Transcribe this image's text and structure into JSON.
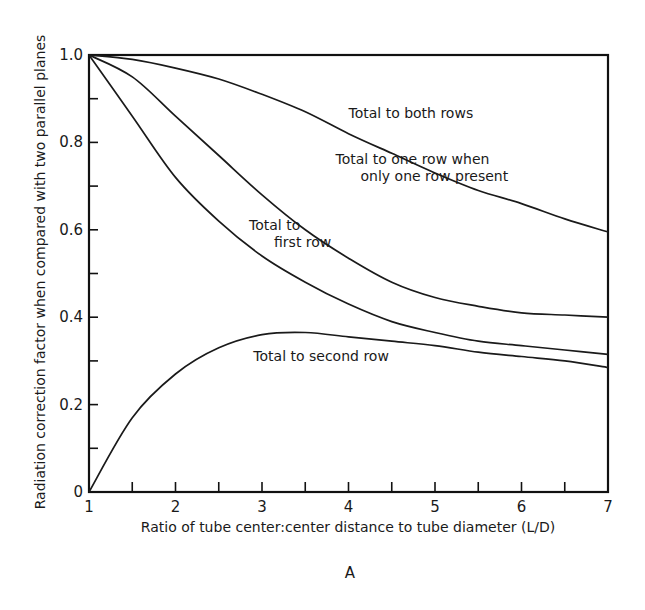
{
  "chart_data": {
    "type": "line",
    "title": "",
    "panel_label": "A",
    "xlabel": "Ratio of tube center:center distance to tube diameter (L/D)",
    "ylabel": "Radiation correction factor when compared with two parallel planes",
    "xlim": [
      1,
      7
    ],
    "ylim": [
      0,
      1.0
    ],
    "x_ticks": [
      1,
      2,
      3,
      4,
      5,
      6,
      7
    ],
    "x_tick_labels": [
      "1",
      "2",
      "3",
      "4",
      "5",
      "6",
      "7"
    ],
    "x_minor_ticks": [
      1.5,
      2.5,
      3.5,
      4.5,
      5.5,
      6.5
    ],
    "y_ticks": [
      0,
      0.2,
      0.4,
      0.6,
      0.8,
      1.0
    ],
    "y_tick_labels": [
      "0",
      "0.2",
      "0.4",
      "0.6",
      "0.8",
      "1.0"
    ],
    "y_minor_ticks": [
      0.1,
      0.3,
      0.5,
      0.7,
      0.9
    ],
    "grid": false,
    "legend": "none (curves labeled inline)",
    "series": [
      {
        "name": "Total to both rows",
        "x": [
          1,
          1.5,
          2,
          2.5,
          3,
          3.5,
          4,
          4.5,
          5,
          5.5,
          6,
          6.5,
          7
        ],
        "y": [
          1.0,
          0.99,
          0.97,
          0.945,
          0.91,
          0.87,
          0.82,
          0.775,
          0.73,
          0.69,
          0.66,
          0.625,
          0.595
        ],
        "label_pos": {
          "x": 4.0,
          "y": 0.855
        },
        "label_lines": [
          "Total to both rows"
        ]
      },
      {
        "name": "Total to one row when only one row present",
        "x": [
          1,
          1.5,
          2,
          2.5,
          3,
          3.5,
          4,
          4.5,
          5,
          5.5,
          6,
          6.5,
          7
        ],
        "y": [
          1.0,
          0.95,
          0.86,
          0.77,
          0.68,
          0.6,
          0.535,
          0.48,
          0.445,
          0.425,
          0.41,
          0.405,
          0.4
        ],
        "label_pos": {
          "x": 3.85,
          "y": 0.75
        },
        "label_lines": [
          "Total to one row when",
          "only one row present"
        ]
      },
      {
        "name": "Total to first row",
        "x": [
          1,
          1.5,
          2,
          2.5,
          3,
          3.5,
          4,
          4.5,
          5,
          5.5,
          6,
          6.5,
          7
        ],
        "y": [
          1.0,
          0.86,
          0.72,
          0.62,
          0.54,
          0.48,
          0.43,
          0.39,
          0.365,
          0.345,
          0.335,
          0.325,
          0.315
        ],
        "label_pos": {
          "x": 2.85,
          "y": 0.6
        },
        "label_lines": [
          "Total to",
          "first row"
        ]
      },
      {
        "name": "Total to second row",
        "x": [
          1,
          1.5,
          2,
          2.5,
          3,
          3.5,
          4,
          4.5,
          5,
          5.5,
          6,
          6.5,
          7
        ],
        "y": [
          0.0,
          0.17,
          0.27,
          0.33,
          0.36,
          0.365,
          0.355,
          0.345,
          0.335,
          0.32,
          0.31,
          0.3,
          0.285
        ],
        "label_pos": {
          "x": 2.9,
          "y": 0.3
        },
        "label_lines": [
          "Total to second row"
        ]
      }
    ]
  }
}
